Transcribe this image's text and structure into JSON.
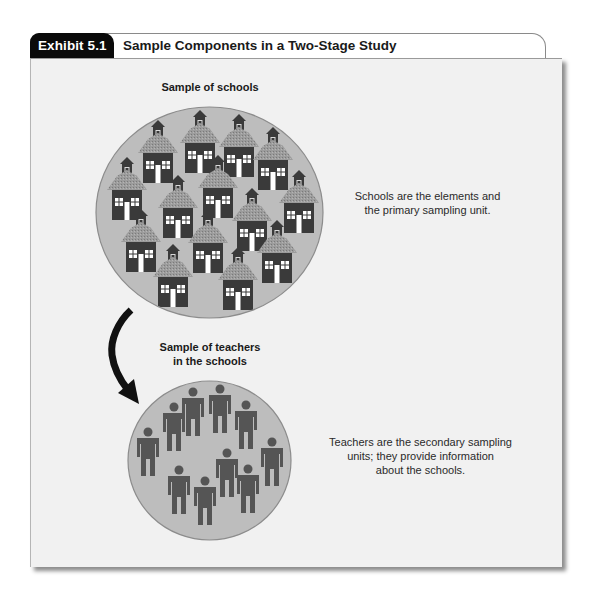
{
  "exhibit": {
    "number_label": "Exhibit 5.1",
    "title": "Sample Components in a Two-Stage Study"
  },
  "stages": {
    "schools": {
      "heading": "Sample of schools",
      "description_line1": "Schools are the elements and",
      "description_line2": "the primary sampling unit.",
      "icon": "school-house-icon",
      "count": 14
    },
    "teachers": {
      "heading_line1": "Sample of teachers",
      "heading_line2": "in the schools",
      "description_line1": "Teachers are the secondary sampling",
      "description_line2": "units; they provide information",
      "description_line3": "about the schools.",
      "icon": "person-icon",
      "count": 10
    }
  },
  "arrow": {
    "icon": "curved-arrow-down-icon",
    "from": "schools",
    "to": "teachers"
  },
  "colors": {
    "circle_fill": "#bdbdbd",
    "circle_stroke": "#8c8c8c",
    "school_body": "#3a3a3a",
    "school_roof": "#9a9a9a",
    "window": "#ffffff",
    "teacher_fill": "#555555",
    "arrow": "#111111",
    "panel_bg": "#f1f1f1",
    "tab_bg": "#0a0a0a"
  }
}
